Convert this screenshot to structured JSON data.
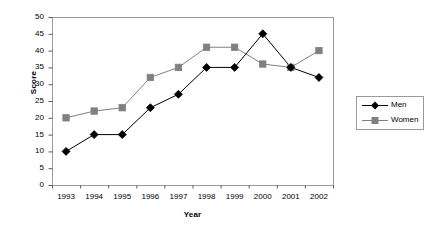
{
  "chart_data": {
    "type": "line",
    "title": "",
    "xlabel": "Year",
    "ylabel": "Score",
    "categories": [
      "1993",
      "1994",
      "1995",
      "1996",
      "1997",
      "1998",
      "1999",
      "2000",
      "2001",
      "2002"
    ],
    "series": [
      {
        "name": "Men",
        "values": [
          10,
          15,
          15,
          23,
          27,
          35,
          35,
          45,
          35,
          32
        ],
        "color": "#000000",
        "marker": "diamond"
      },
      {
        "name": "Women",
        "values": [
          20,
          22,
          23,
          32,
          35,
          41,
          41,
          36,
          35,
          40
        ],
        "color": "#808080",
        "marker": "square"
      }
    ],
    "ylim": [
      0,
      50
    ],
    "yticks": [
      0,
      5,
      10,
      15,
      20,
      25,
      30,
      35,
      40,
      45,
      50
    ],
    "ytick_labels": [
      "0",
      "5",
      "10",
      "15",
      "20",
      "25",
      "30",
      "35",
      "40",
      "45",
      "50"
    ],
    "grid": false,
    "legend_position": "right",
    "legend_entries": [
      "Men",
      "Women"
    ],
    "plot_border_color": "#9a9a9a",
    "background_color": "#ffffff"
  },
  "legend": {
    "items": [
      {
        "label": "Men"
      },
      {
        "label": "Women"
      }
    ]
  },
  "axes": {
    "x_title": "Year",
    "y_title": "Score"
  }
}
